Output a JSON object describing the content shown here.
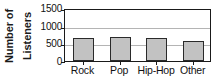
{
  "chart_data": {
    "type": "bar",
    "title": "",
    "xlabel": "",
    "ylabel": "Number of Listeners",
    "ylabel_lines": [
      "Number of",
      "Listeners"
    ],
    "categories": [
      "Rock",
      "Pop",
      "Hip-Hop",
      "Other"
    ],
    "values": [
      660,
      690,
      660,
      580
    ],
    "ylim": [
      0,
      1500
    ],
    "yticks": [
      0,
      500,
      1000,
      1500
    ],
    "ytick_labels": [
      "0",
      "500",
      "1000",
      "1500"
    ],
    "grid": true,
    "grid_axis": "y",
    "legend": "none",
    "bar_color": "#c2c2c2",
    "bar_edge_color": "#2a2a2a",
    "grid_color": "#b4b4b4",
    "axis_color": "#1a1a1a"
  }
}
